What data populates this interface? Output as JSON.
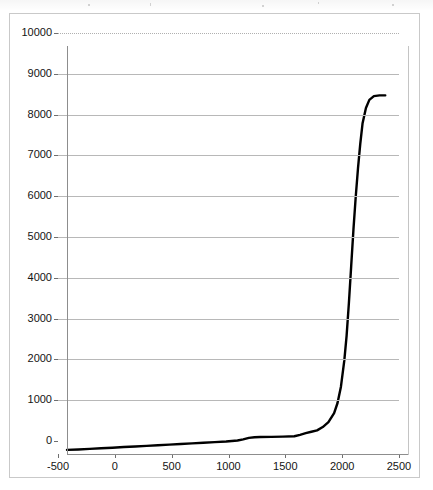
{
  "chart_data": {
    "type": "line",
    "title": "",
    "subtitle": "",
    "xlabel": "",
    "ylabel": "",
    "xlim": [
      -500,
      2500
    ],
    "ylim": [
      0,
      10000
    ],
    "grid": true,
    "grid_axis": "y",
    "legend": false,
    "legend_position": "none",
    "line_color": "#000000",
    "background_color": "#ffffff",
    "gridline_color": "#b8b8b8",
    "axis_color": "#8d8d8d",
    "frame_color": "#c9c9c9",
    "y_ticks": [
      10000,
      9000,
      8000,
      7000,
      6000,
      5000,
      4000,
      3000,
      2000,
      1000,
      0
    ],
    "y_tick_labels": [
      "10000",
      "9000",
      "8000",
      "7000",
      "6000",
      "5000",
      "4000",
      "3000",
      "2000",
      "1000",
      "0"
    ],
    "x_ticks": [
      -500,
      0,
      500,
      1000,
      1500,
      2000,
      2500
    ],
    "x_tick_labels": [
      "-500",
      "0",
      "500",
      "1000",
      "1500",
      "2000",
      "2500"
    ],
    "series": [
      {
        "name": "series-1",
        "x": [
          -500,
          -400,
          -300,
          -200,
          -100,
          0,
          100,
          200,
          300,
          400,
          500,
          600,
          700,
          800,
          900,
          1000,
          1050,
          1100,
          1150,
          1200,
          1300,
          1400,
          1500,
          1550,
          1600,
          1650,
          1700,
          1750,
          1800,
          1850,
          1880,
          1910,
          1940,
          1960,
          1980,
          2000,
          2020,
          2040,
          2060,
          2080,
          2100,
          2130,
          2160,
          2200,
          2250,
          2300
        ],
        "y": [
          100,
          110,
          125,
          140,
          155,
          170,
          185,
          200,
          215,
          230,
          245,
          260,
          275,
          290,
          305,
          330,
          360,
          395,
          410,
          415,
          420,
          425,
          435,
          470,
          510,
          545,
          580,
          660,
          780,
          1000,
          1250,
          1650,
          2300,
          2900,
          3700,
          4600,
          5500,
          6300,
          7000,
          7600,
          8100,
          8480,
          8680,
          8770,
          8790,
          8790
        ]
      }
    ]
  }
}
